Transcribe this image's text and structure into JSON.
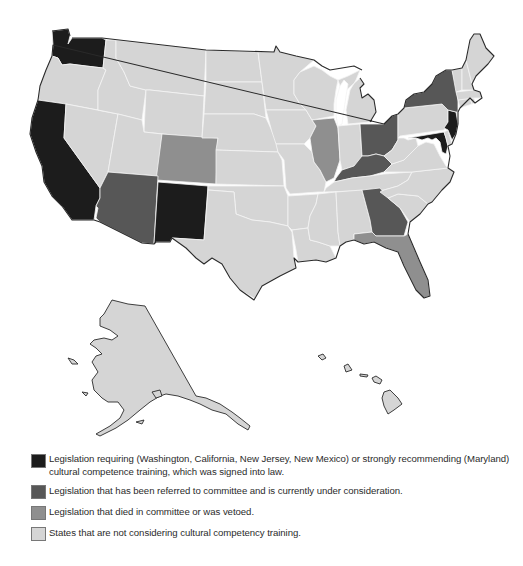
{
  "map": {
    "title": "",
    "colors": {
      "signed_into_law": "#1c1c1c",
      "under_consideration": "#575757",
      "died_or_vetoed": "#8f8f8f",
      "not_considering": "#d5d5d5",
      "border": "#f4f4f4",
      "coast": "#2a2a2a"
    },
    "categories": {
      "signed_into_law": [
        "Washington",
        "California",
        "New Jersey",
        "New Mexico",
        "Maryland"
      ],
      "under_consideration": [
        "Arizona",
        "New York",
        "Ohio",
        "Kentucky",
        "Georgia"
      ],
      "died_or_vetoed": [
        "Colorado",
        "Illinois",
        "Florida"
      ],
      "not_considering": [
        "Oregon",
        "Idaho",
        "Montana",
        "Wyoming",
        "Nevada",
        "Utah",
        "North Dakota",
        "South Dakota",
        "Nebraska",
        "Kansas",
        "Oklahoma",
        "Texas",
        "Minnesota",
        "Iowa",
        "Missouri",
        "Arkansas",
        "Louisiana",
        "Wisconsin",
        "Michigan",
        "Indiana",
        "Tennessee",
        "Mississippi",
        "Alabama",
        "South Carolina",
        "North Carolina",
        "Virginia",
        "West Virginia",
        "Pennsylvania",
        "Delaware",
        "Connecticut",
        "Rhode Island",
        "Massachusetts",
        "Vermont",
        "New Hampshire",
        "Maine",
        "Alaska",
        "Hawaii"
      ]
    }
  },
  "legend": {
    "items": [
      {
        "key": "signed_into_law",
        "color": "#1c1c1c",
        "label": "Legislation requiring (Washington, California, New Jersey, New Mexico) or strongly recommending (Maryland) cultural competence training, which was signed into law."
      },
      {
        "key": "under_consideration",
        "color": "#575757",
        "label": "Legislation that has been referred to committee and is currently under consideration."
      },
      {
        "key": "died_or_vetoed",
        "color": "#8f8f8f",
        "label": "Legislation that died in committee or was vetoed."
      },
      {
        "key": "not_considering",
        "color": "#d5d5d5",
        "label": "States that are not considering cultural competency training."
      }
    ]
  }
}
